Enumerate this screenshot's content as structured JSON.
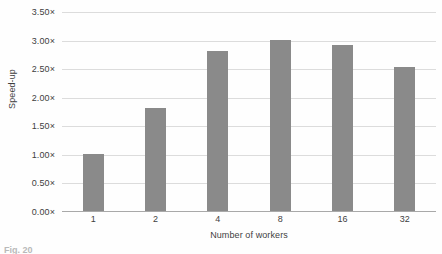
{
  "chart_data": {
    "type": "bar",
    "title": "",
    "subtitle": "",
    "xlabel": "Number of workers",
    "ylabel": "Speed-up",
    "categories": [
      "1",
      "2",
      "4",
      "8",
      "16",
      "32"
    ],
    "values": [
      1.0,
      1.8,
      2.8,
      3.0,
      2.9,
      2.52
    ],
    "series": [
      {
        "name": "Speed-up",
        "values": [
          1.0,
          1.8,
          2.8,
          3.0,
          2.9,
          2.52
        ]
      }
    ],
    "ylim": [
      0.0,
      3.5
    ],
    "ytick_values": [
      0.0,
      0.5,
      1.0,
      1.5,
      2.0,
      2.5,
      3.0,
      3.5
    ],
    "ytick_labels": [
      "0.00×",
      "0.50×",
      "1.00×",
      "1.50×",
      "2.00×",
      "2.50×",
      "3.00×",
      "3.50×"
    ],
    "grid": true,
    "grid_axis": "y",
    "legend": false,
    "legend_position": "none",
    "annotations": [],
    "colors": {
      "bar": "#8a8a8a",
      "gridline": "#dcdcdc",
      "axis": "#a9a9a9",
      "text": "#3f3f3f",
      "background": "#fefefe"
    }
  },
  "caption": {
    "text": "Fig. 20"
  }
}
